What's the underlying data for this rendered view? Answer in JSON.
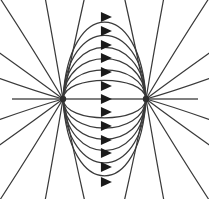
{
  "figure": {
    "kind": "field-line-diagram",
    "background_color": "#ffffff",
    "line_color": "#3a3a3a",
    "axis_color": "#555555",
    "arrow_color": "#1a1a1a",
    "charge_color": "#2e2e2e",
    "width": 209,
    "height": 199
  },
  "chart_data": {
    "type": "scatter",
    "subtitle": "",
    "xlabel": "",
    "ylabel": "",
    "xlim": [
      0,
      209
    ],
    "ylim": [
      0,
      199
    ],
    "grid": false,
    "legend": "none",
    "annotations": [],
    "charges": [
      {
        "name": "source-charge",
        "sign": "+",
        "x": 63,
        "y": 99,
        "radius": 3.2
      },
      {
        "name": "sink-charge",
        "sign": "-",
        "x": 146,
        "y": 99,
        "radius": 3.2
      }
    ],
    "axis_segment": {
      "x1": 12,
      "y1": 99,
      "x2": 198,
      "y2": 99
    },
    "arrow_x": 107,
    "arrow_size": {
      "length": 11,
      "half_height": 5
    },
    "arrow_positions_y": [
      17,
      31,
      45,
      58,
      72,
      86,
      99,
      112,
      126,
      140,
      153,
      167,
      182
    ],
    "arc_bulges": [
      82,
      68,
      55,
      43,
      31,
      20,
      0,
      -20,
      -31,
      -43,
      -55,
      -68,
      -82
    ],
    "radial_angles_deg": [
      18,
      36,
      56,
      78,
      100,
      122,
      144,
      162,
      -18,
      -36,
      -56,
      -78,
      -100,
      -122,
      -144,
      -162
    ],
    "series": [
      {
        "name": "closed-field-lines",
        "count": 13,
        "description": "Arcs running from the left charge to the right charge, arrowheads pointing right"
      },
      {
        "name": "escaping-field-lines",
        "count": 16,
        "description": "Straight radial lines leaving each charge toward the image border"
      }
    ]
  }
}
